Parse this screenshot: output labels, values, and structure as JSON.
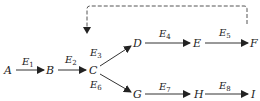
{
  "diagram": {
    "type": "directed-graph",
    "nodes": [
      {
        "id": "A",
        "label": "A",
        "x": 7,
        "y": 73
      },
      {
        "id": "B",
        "label": "B",
        "x": 50,
        "y": 73
      },
      {
        "id": "C",
        "label": "C",
        "x": 92,
        "y": 73
      },
      {
        "id": "D",
        "label": "D",
        "x": 136,
        "y": 46
      },
      {
        "id": "E",
        "label": "E",
        "x": 196,
        "y": 46
      },
      {
        "id": "F",
        "label": "F",
        "x": 253,
        "y": 46
      },
      {
        "id": "G",
        "label": "G",
        "x": 136,
        "y": 97
      },
      {
        "id": "H",
        "label": "H",
        "x": 197,
        "y": 97
      },
      {
        "id": "I",
        "label": "I",
        "x": 253,
        "y": 97
      }
    ],
    "edges": [
      {
        "id": "E1",
        "base": "E",
        "sub": "1",
        "from": "A",
        "to": "B",
        "style": "solid"
      },
      {
        "id": "E2",
        "base": "E",
        "sub": "2",
        "from": "B",
        "to": "C",
        "style": "solid"
      },
      {
        "id": "E3",
        "base": "E",
        "sub": "3",
        "from": "C",
        "to": "D",
        "style": "solid"
      },
      {
        "id": "E4",
        "base": "E",
        "sub": "4",
        "from": "D",
        "to": "E",
        "style": "solid"
      },
      {
        "id": "E5",
        "base": "E",
        "sub": "5",
        "from": "E",
        "to": "F",
        "style": "solid"
      },
      {
        "id": "E6",
        "base": "E",
        "sub": "6",
        "from": "C",
        "to": "G",
        "style": "solid"
      },
      {
        "id": "E7",
        "base": "E",
        "sub": "7",
        "from": "G",
        "to": "H",
        "style": "solid"
      },
      {
        "id": "E8",
        "base": "E",
        "sub": "8",
        "from": "H",
        "to": "I",
        "style": "solid"
      },
      {
        "id": "feedback",
        "from": "F",
        "to": "C",
        "style": "dashed",
        "label": ""
      }
    ],
    "colors": {
      "line": "#333333",
      "dashed": "#555555",
      "text": "#222222",
      "background": "#ffffff"
    }
  }
}
